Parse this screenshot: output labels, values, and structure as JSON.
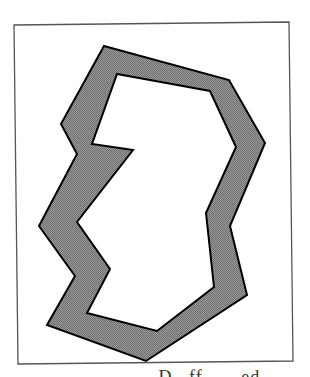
{
  "figure": {
    "frame": {
      "points": [
        [
          14,
          25
        ],
        [
          289,
          22
        ],
        [
          293,
          361
        ],
        [
          18,
          364
        ]
      ],
      "stroke": "#555555"
    },
    "outer_polygon": {
      "points": [
        [
          104,
          46
        ],
        [
          229,
          80
        ],
        [
          265,
          143
        ],
        [
          230,
          226
        ],
        [
          247,
          295
        ],
        [
          146,
          361
        ],
        [
          47,
          325
        ],
        [
          75,
          276
        ],
        [
          39,
          226
        ],
        [
          77,
          154
        ],
        [
          61,
          124
        ]
      ],
      "fill": "#8a8a8a",
      "stroke": "#000000"
    },
    "inner_polygon": {
      "points": [
        [
          117,
          74
        ],
        [
          210,
          91
        ],
        [
          236,
          147
        ],
        [
          206,
          213
        ],
        [
          214,
          287
        ],
        [
          157,
          331
        ],
        [
          87,
          313
        ],
        [
          110,
          269
        ],
        [
          77,
          222
        ],
        [
          133,
          150
        ],
        [
          92,
          144
        ]
      ],
      "fill": "#ffffff",
      "stroke": "#000000"
    }
  },
  "caption": {
    "text": "...... D...ff...... ed....."
  }
}
